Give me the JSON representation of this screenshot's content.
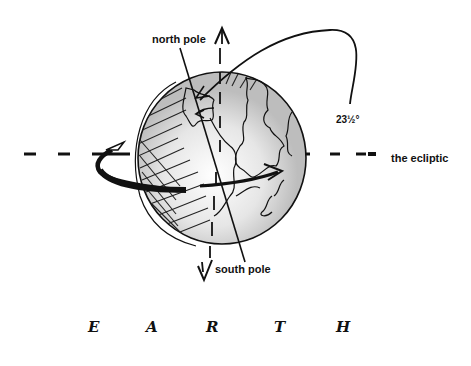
{
  "diagram": {
    "title_letters": [
      "E",
      "A",
      "R",
      "T",
      "H"
    ],
    "labels": {
      "north_pole": "north pole",
      "south_pole": "south pole",
      "tilt_angle": "23½°",
      "ecliptic": "the ecliptic"
    },
    "elements": {
      "globe": "Earth sphere with continents, shaded night side",
      "axis": "tilted rotation axis",
      "vertical_reference": "dashed vertical line with arrows up and down",
      "ecliptic_line": "dashed horizontal line",
      "rotation_arrow": "curved arrow around equator",
      "angle_arc": "arc indicating axial tilt"
    },
    "colors": {
      "ink": "#111111",
      "background": "#ffffff",
      "shade": "#cccccc"
    }
  }
}
